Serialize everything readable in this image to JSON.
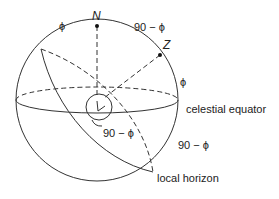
{
  "diagram": {
    "points": {
      "north_pole": {
        "label": "N"
      },
      "zenith": {
        "label": "Z"
      }
    },
    "angle_labels": {
      "top_left": "ϕ",
      "top_right": "90 − ϕ",
      "right_upper": "ϕ",
      "center": "90 − ϕ",
      "right_lower": "90 − ϕ"
    },
    "circle_labels": {
      "equator": "celestial equator",
      "horizon": "local horizon"
    },
    "colors": {
      "stroke": "#333333",
      "text": "#222222",
      "background": "#ffffff"
    }
  }
}
